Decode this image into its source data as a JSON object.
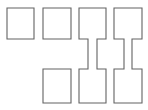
{
  "figure": {
    "title": "",
    "background_color": "#ffffff",
    "stroke_color": "#636363",
    "fill_color": "#ffffff",
    "stroke_width": 1.1,
    "width": 148,
    "height": 110
  },
  "shapes": [
    {
      "id": "col1-top-rect",
      "type": "rectangle",
      "column": 1,
      "row": "top",
      "connected": false,
      "points": "7,8 34,8 34,39 7,39"
    },
    {
      "id": "col2-top-rect",
      "type": "rectangle",
      "column": 2,
      "row": "top",
      "connected": false,
      "points": "43,8 71,8 71,39 43,39"
    },
    {
      "id": "col2-bottom-rect",
      "type": "rectangle",
      "column": 2,
      "row": "bottom",
      "connected": false,
      "points": "43,69 71,69 71,103 43,103"
    },
    {
      "id": "col3-dumbbell",
      "type": "dumbbell",
      "column": 3,
      "row": "top-bottom",
      "connected": true,
      "points": "79,8 106,8 106,39 97,39 97,69 106,69 106,103 79,103 79,69 88,69 88,39 79,39"
    },
    {
      "id": "col4-dumbbell",
      "type": "dumbbell",
      "column": 4,
      "row": "top-bottom",
      "connected": true,
      "points": "114,8 142,8 142,39 132,39 132,69 142,69 142,103 114,103 114,69 124,69 124,39 114,39"
    }
  ]
}
